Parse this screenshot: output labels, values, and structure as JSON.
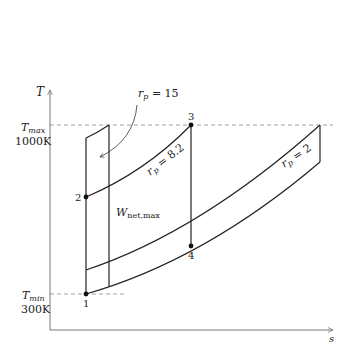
{
  "diagram": {
    "type": "T-s diagram, Brayton cycle",
    "axes": {
      "y_label": "T",
      "x_label": "s"
    },
    "levels": {
      "t_max_label": "T",
      "t_max_sub": "max",
      "t_max_value": "1000K",
      "t_min_label": "T",
      "t_min_sub": "min",
      "t_min_value": "300K"
    },
    "states": [
      {
        "id": "1",
        "label": "1"
      },
      {
        "id": "2",
        "label": "2"
      },
      {
        "id": "3",
        "label": "3"
      },
      {
        "id": "4",
        "label": "4"
      }
    ],
    "pressure_ratios": [
      {
        "name": "rp15",
        "label_var": "r",
        "label_sub": "p",
        "label_eq": " = 15"
      },
      {
        "name": "rp8_2",
        "label_var": "r",
        "label_sub": "p",
        "label_eq": " = 8.2"
      },
      {
        "name": "rp2",
        "label_var": "r",
        "label_sub": "p",
        "label_eq": " = 2"
      }
    ],
    "work_label": {
      "main": "W",
      "sub": "net,max"
    },
    "colors": {
      "line": "#222222",
      "axis": "#777777",
      "dashed": "#888888"
    }
  }
}
